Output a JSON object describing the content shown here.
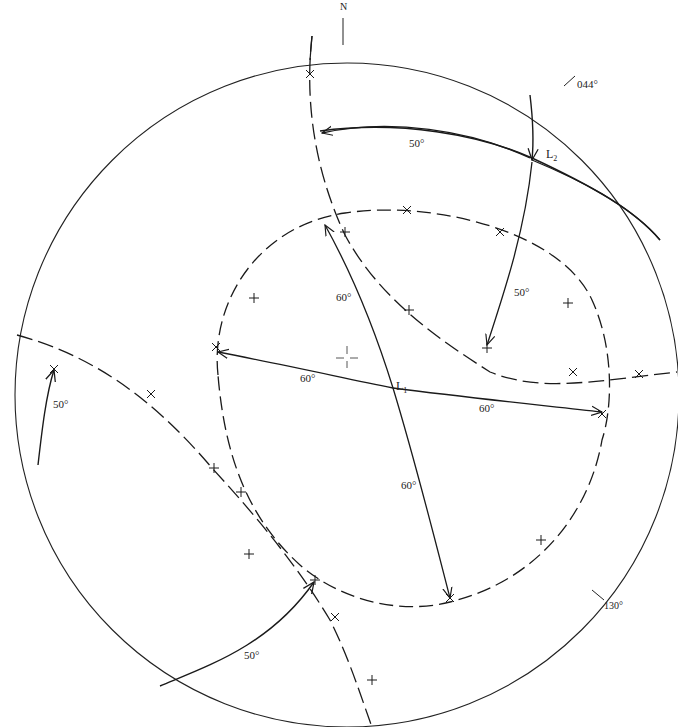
{
  "figure": {
    "type": "stereonet",
    "primitive": {
      "cx": 347,
      "cy": 395,
      "r": 332,
      "color": "#222222"
    },
    "north_label": "N",
    "strike_labels": [
      {
        "text": "044°",
        "x": 575,
        "y": 82
      },
      {
        "text": "130°",
        "x": 604,
        "y": 605
      }
    ],
    "lineations": [
      {
        "name": "L",
        "sub": "1",
        "x": 396,
        "y": 385
      },
      {
        "name": "L",
        "sub": "2",
        "x": 546,
        "y": 153
      }
    ],
    "angle_labels": [
      {
        "text": "50°",
        "x": 409,
        "y": 142
      },
      {
        "text": "50°",
        "x": 514,
        "y": 292
      },
      {
        "text": "60°",
        "x": 336,
        "y": 296
      },
      {
        "text": "60°",
        "x": 300,
        "y": 378
      },
      {
        "text": "60°",
        "x": 479,
        "y": 407
      },
      {
        "text": "60°",
        "x": 401,
        "y": 484
      },
      {
        "text": "50°",
        "x": 53,
        "y": 403
      },
      {
        "text": "50°",
        "x": 244,
        "y": 654
      }
    ],
    "center_marker": "cross",
    "line_color": "#1a1a1a"
  }
}
